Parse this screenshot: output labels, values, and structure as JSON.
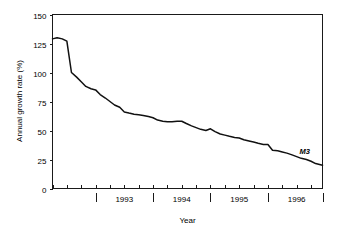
{
  "chart_data": {
    "type": "line",
    "title": "",
    "xlabel": "Year",
    "ylabel": "Annual growth rate (%)",
    "ylim": [
      0,
      150
    ],
    "yticks": [
      0,
      25,
      50,
      75,
      100,
      125,
      150
    ],
    "ytick_labels": [
      "0",
      "25",
      "50",
      "75",
      "100",
      "125",
      "150"
    ],
    "xlim": [
      1992.25,
      1996.95
    ],
    "xtick_labels": [
      "1993",
      "1994",
      "1995",
      "1996"
    ],
    "xtick_label_positions": [
      1993.5,
      1994.5,
      1995.5,
      1996.5
    ],
    "major_ticks": [
      1993.0,
      1994.0,
      1995.0,
      1996.0,
      1996.95
    ],
    "minor_tick_interval": 0.25,
    "grid": false,
    "legend": "none",
    "annotations": [
      {
        "text": "M3",
        "x": 1996.55,
        "y": 29.5,
        "style": "italic"
      }
    ],
    "series": [
      {
        "name": "M3",
        "label": "M3",
        "x": [
          1992.25,
          1992.33,
          1992.42,
          1992.5,
          1992.58,
          1992.67,
          1992.75,
          1992.83,
          1992.92,
          1993.0,
          1993.08,
          1993.17,
          1993.25,
          1993.33,
          1993.42,
          1993.5,
          1993.58,
          1993.67,
          1993.75,
          1993.83,
          1993.92,
          1994.0,
          1994.08,
          1994.17,
          1994.25,
          1994.33,
          1994.42,
          1994.5,
          1994.58,
          1994.67,
          1994.75,
          1994.83,
          1994.92,
          1995.0,
          1995.08,
          1995.17,
          1995.25,
          1995.33,
          1995.42,
          1995.5,
          1995.58,
          1995.67,
          1995.75,
          1995.83,
          1995.92,
          1996.0,
          1996.08,
          1996.17,
          1996.25,
          1996.33,
          1996.42,
          1996.5,
          1996.58,
          1996.67,
          1996.75,
          1996.83,
          1996.95
        ],
        "values": [
          129,
          130,
          129,
          127,
          100,
          96,
          92,
          88,
          86,
          85,
          81,
          78,
          75,
          72,
          70,
          66,
          65,
          64,
          63.5,
          63,
          62,
          61,
          59,
          58,
          57.5,
          57.5,
          58,
          58,
          56,
          54,
          52.5,
          51,
          50,
          51.5,
          49,
          47,
          46,
          45,
          44,
          43.5,
          42,
          41,
          40,
          39,
          38,
          38,
          33,
          32.5,
          31.5,
          30.5,
          29,
          27.5,
          26,
          25,
          23.5,
          21.5,
          20
        ]
      }
    ]
  }
}
